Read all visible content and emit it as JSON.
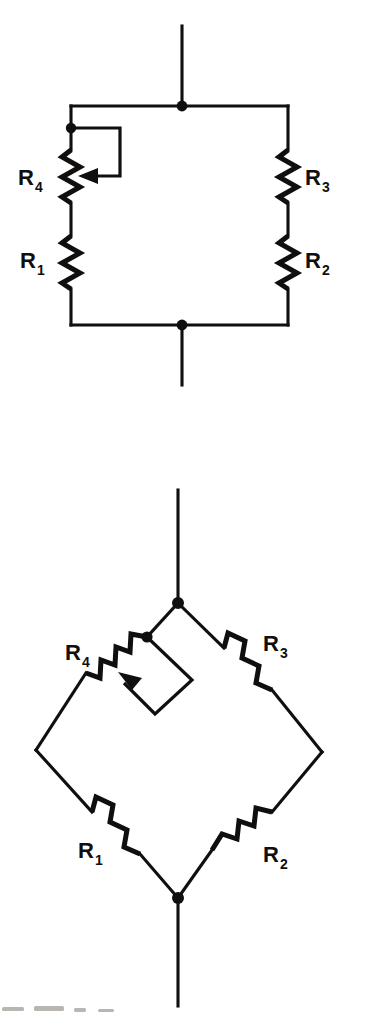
{
  "document": {
    "kind": "circuit-diagram-sheet",
    "page_background": "#ffffff",
    "ink_color": "#100f0d",
    "width": 373,
    "height": 1016
  },
  "figures": [
    {
      "id": "square-bridge",
      "title": "Wheatstone bridge drawn as a rectangle",
      "orientation": "rectangular",
      "components": [
        {
          "ref": "R4",
          "label": "R",
          "subscript": "4",
          "type": "potentiometer",
          "branch": "left-upper",
          "has_wiper": true,
          "wiper_direction": "left"
        },
        {
          "ref": "R1",
          "label": "R",
          "subscript": "1",
          "type": "resistor",
          "branch": "left-lower",
          "has_wiper": false
        },
        {
          "ref": "R3",
          "label": "R",
          "subscript": "3",
          "type": "resistor",
          "branch": "right-upper",
          "has_wiper": false
        },
        {
          "ref": "R2",
          "label": "R",
          "subscript": "2",
          "type": "resistor",
          "branch": "right-lower",
          "has_wiper": false
        }
      ],
      "nodes": [
        {
          "name": "top-terminal-node",
          "role": "supply-positive"
        },
        {
          "name": "left-wiper-tap-node",
          "role": "potentiometer-top-tap"
        },
        {
          "name": "bottom-terminal-node",
          "role": "supply-negative"
        }
      ],
      "leads": [
        {
          "name": "top-lead",
          "direction": "up"
        },
        {
          "name": "bottom-lead",
          "direction": "down"
        }
      ]
    },
    {
      "id": "diamond-bridge",
      "title": "Wheatstone bridge drawn as a diamond",
      "orientation": "diamond",
      "components": [
        {
          "ref": "R4",
          "label": "R",
          "subscript": "4",
          "type": "potentiometer",
          "branch": "upper-left",
          "has_wiper": true,
          "wiper_direction": "down-left"
        },
        {
          "ref": "R1",
          "label": "R",
          "subscript": "1",
          "type": "resistor",
          "branch": "lower-left",
          "has_wiper": false
        },
        {
          "ref": "R3",
          "label": "R",
          "subscript": "3",
          "type": "resistor",
          "branch": "upper-right",
          "has_wiper": false
        },
        {
          "ref": "R2",
          "label": "R",
          "subscript": "2",
          "type": "resistor",
          "branch": "lower-right",
          "has_wiper": false
        }
      ],
      "nodes": [
        {
          "name": "top-apex-node",
          "role": "supply-positive"
        },
        {
          "name": "upper-left-wiper-tap-node",
          "role": "potentiometer-top-tap"
        },
        {
          "name": "bottom-apex-node",
          "role": "supply-negative"
        }
      ],
      "leads": [
        {
          "name": "top-lead",
          "direction": "up"
        },
        {
          "name": "bottom-lead",
          "direction": "down"
        }
      ]
    }
  ]
}
